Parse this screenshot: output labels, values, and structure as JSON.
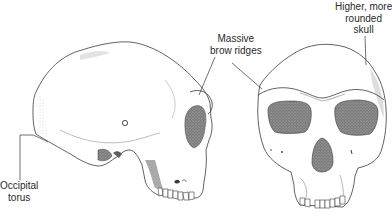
{
  "figure": {
    "type": "anatomical-illustration",
    "views": [
      {
        "name": "lateral-view",
        "side": "left"
      },
      {
        "name": "frontal-view",
        "side": "right"
      }
    ]
  },
  "labels": {
    "brow_ridges": {
      "line1": "Massive",
      "line2": "brow ridges"
    },
    "skull_shape": {
      "line1": "Higher, more",
      "line2": "rounded",
      "line3": "skull"
    },
    "occipital_torus": {
      "line1": "Occipital",
      "line2": "torus"
    }
  },
  "colors": {
    "background": "#ffffff",
    "outline": "#3a3a3a",
    "shading": "#8a8a8a",
    "dark_fill": "#6a6a6a",
    "label_text": "#2a2a2a",
    "leader_line": "#333333"
  }
}
